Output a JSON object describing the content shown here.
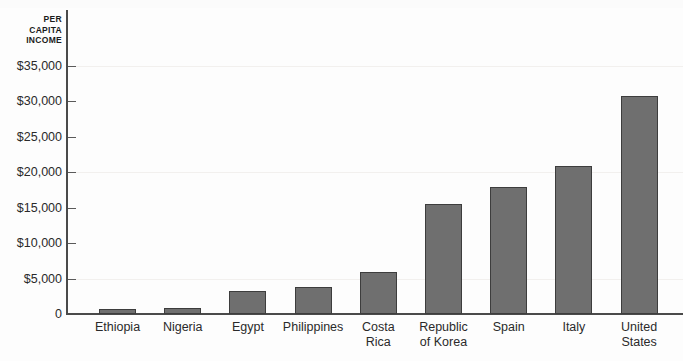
{
  "chart_data": {
    "type": "bar",
    "title": "",
    "subtitle": "",
    "xlabel": "",
    "ylabel": "PER CAPITA INCOME",
    "ylabel_lines": [
      "PER",
      "CAPITA",
      "INCOME"
    ],
    "categories": [
      "Ethiopia",
      "Nigeria",
      "Egypt",
      "Philippines",
      "Costa\nRica",
      "Republic\nof Korea",
      "Spain",
      "Italy",
      "United\nStates"
    ],
    "values": [
      700,
      800,
      3300,
      3800,
      5900,
      15500,
      17900,
      20900,
      30800
    ],
    "ylim": [
      0,
      35000
    ],
    "ytick_values": [
      0,
      5000,
      10000,
      15000,
      20000,
      25000,
      30000,
      35000
    ],
    "ytick_labels": [
      "0",
      "$5,000",
      "$10,000",
      "$15,000",
      "$20,000",
      "$25,000",
      "$30,000",
      "$35,000"
    ],
    "grid": true,
    "legend": null,
    "bar_color": "#6f6f6f",
    "bar_border_color": "#3d3d3d",
    "axis_color": "#4a4a4a",
    "text_color": "#2a2a2a",
    "background": "#fdfdfd"
  }
}
